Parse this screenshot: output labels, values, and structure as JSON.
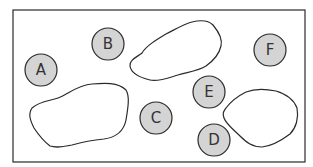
{
  "diagram": {
    "frame": {
      "x": 13,
      "y": 10,
      "w": 292,
      "h": 152
    },
    "colors": {
      "stroke": "#2a2a2a",
      "circle_fill": "#d4d4d4",
      "blob_fill": "#ffffff"
    },
    "circles": [
      {
        "label": "A",
        "cx": 41,
        "cy": 70,
        "r": 16
      },
      {
        "label": "B",
        "cx": 108,
        "cy": 44,
        "r": 16
      },
      {
        "label": "C",
        "cx": 156,
        "cy": 118,
        "r": 16
      },
      {
        "label": "D",
        "cx": 214,
        "cy": 140,
        "r": 16
      },
      {
        "label": "E",
        "cx": 209,
        "cy": 92,
        "r": 16
      },
      {
        "label": "F",
        "cx": 270,
        "cy": 50,
        "r": 16
      }
    ],
    "blobs": [
      {
        "name": "top-middle-blob"
      },
      {
        "name": "left-blob"
      },
      {
        "name": "right-blob"
      }
    ]
  }
}
